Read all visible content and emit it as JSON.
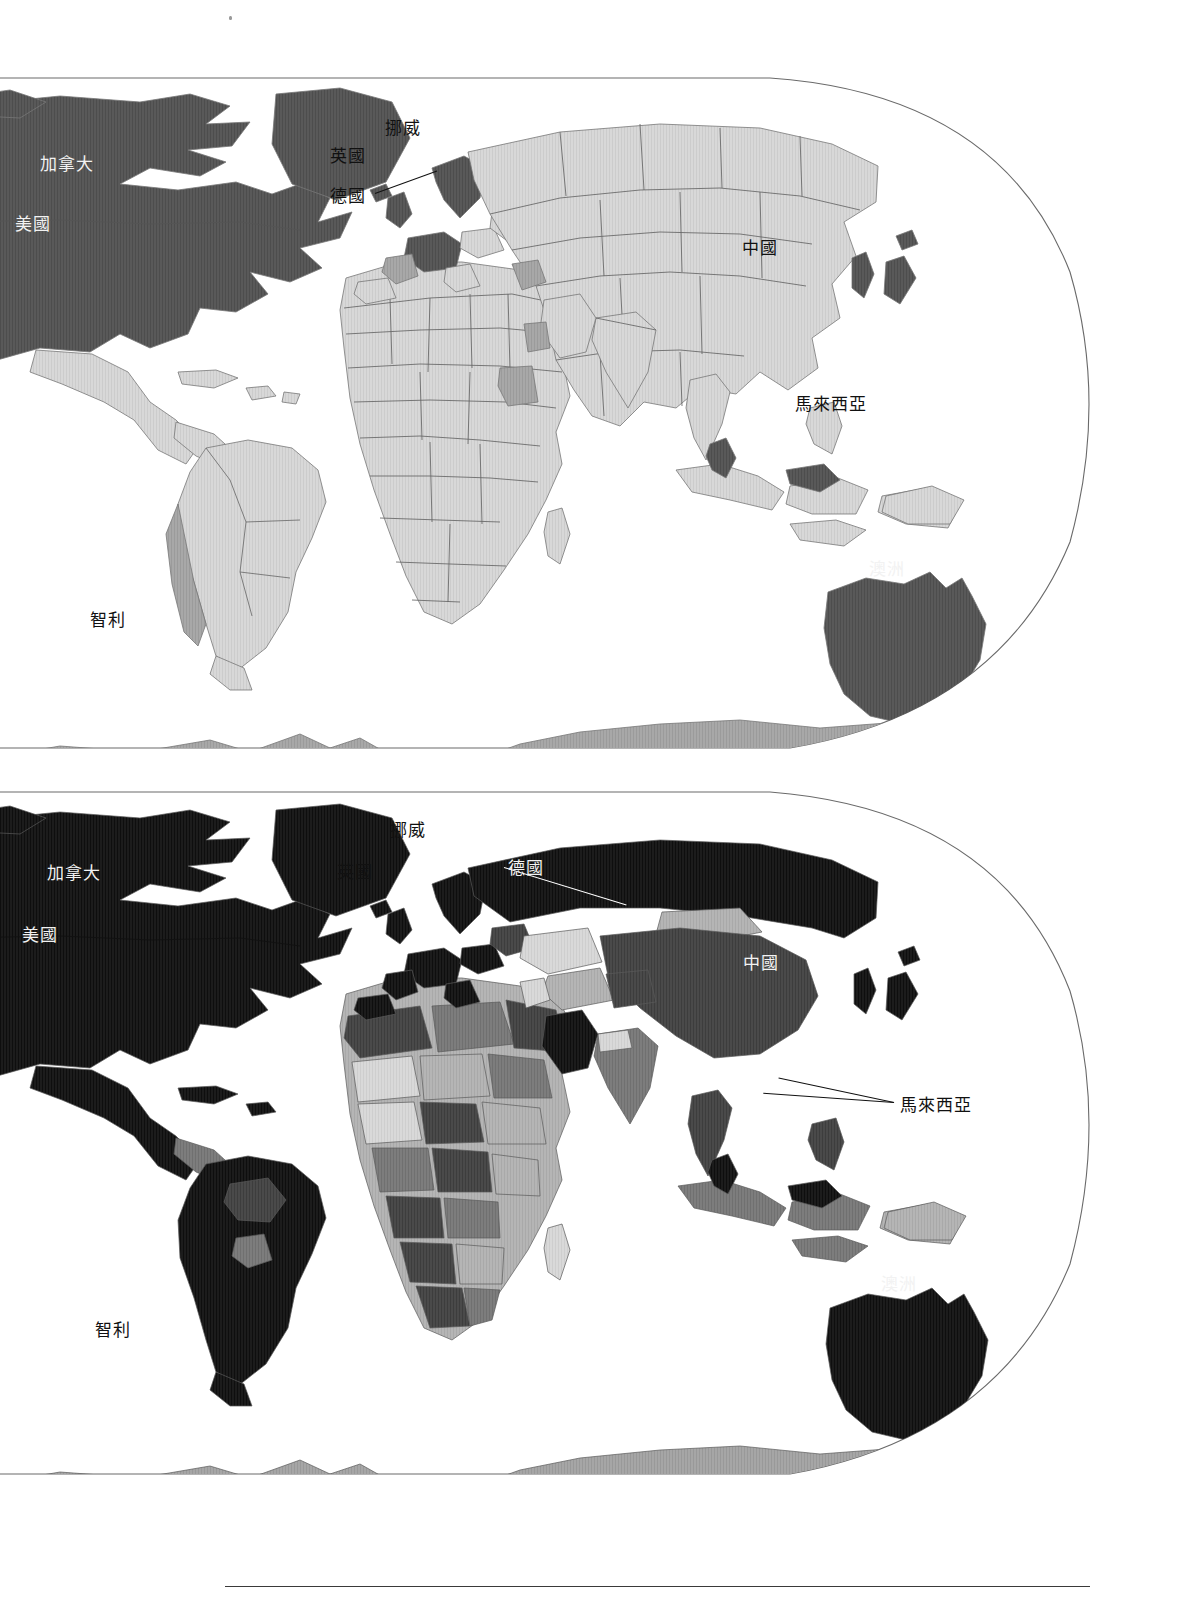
{
  "document": {
    "kind": "two-panel world choropleth map figure",
    "panel_count": 2,
    "footer_rule": true
  },
  "map_top": {
    "name": "upper-world-map",
    "style": "light-shaded choropleth, light-gray base countries, dark-gray highlighted countries",
    "labels": [
      {
        "id": "canada",
        "text": "加拿大",
        "x": 40,
        "y": 156,
        "tone": "light"
      },
      {
        "id": "usa",
        "text": "美國",
        "x": 15,
        "y": 216,
        "tone": "light"
      },
      {
        "id": "norway",
        "text": "挪威",
        "x": 385,
        "y": 120,
        "tone": "dark"
      },
      {
        "id": "uk",
        "text": "英國",
        "x": 330,
        "y": 148,
        "tone": "dark"
      },
      {
        "id": "germany",
        "text": "德國",
        "x": 330,
        "y": 188,
        "tone": "dark"
      },
      {
        "id": "china",
        "text": "中國",
        "x": 742,
        "y": 240,
        "tone": "dark"
      },
      {
        "id": "malaysia",
        "text": "馬來西亞",
        "x": 795,
        "y": 396,
        "tone": "dark"
      },
      {
        "id": "australia",
        "text": "澳洲",
        "x": 869,
        "y": 561,
        "tone": "light"
      },
      {
        "id": "chile",
        "text": "智利",
        "x": 90,
        "y": 612,
        "tone": "dark"
      }
    ],
    "leaders": [
      {
        "id": "germany-leader",
        "x": 375,
        "y": 193,
        "length": 66,
        "angle": -20,
        "tone": "dark"
      }
    ]
  },
  "map_bottom": {
    "name": "lower-world-map",
    "style": "dark-shaded choropleth, near-black highlighted countries, mid-gray other countries",
    "labels": [
      {
        "id": "canada",
        "text": "加拿大",
        "x": 47,
        "y": 865,
        "tone": "light"
      },
      {
        "id": "usa",
        "text": "美國",
        "x": 22,
        "y": 927,
        "tone": "light"
      },
      {
        "id": "norway",
        "text": "挪威",
        "x": 390,
        "y": 822,
        "tone": "dark"
      },
      {
        "id": "uk",
        "text": "英國",
        "x": 337,
        "y": 864,
        "tone": "dark"
      },
      {
        "id": "germany",
        "text": "德國",
        "x": 508,
        "y": 860,
        "tone": "light"
      },
      {
        "id": "china",
        "text": "中國",
        "x": 743,
        "y": 955,
        "tone": "light"
      },
      {
        "id": "malaysia",
        "text": "馬來西亞",
        "x": 900,
        "y": 1097,
        "tone": "dark"
      },
      {
        "id": "australia",
        "text": "澳洲",
        "x": 881,
        "y": 1276,
        "tone": "light"
      },
      {
        "id": "chile",
        "text": "智利",
        "x": 95,
        "y": 1322,
        "tone": "dark"
      }
    ],
    "leaders": [
      {
        "id": "germany-leader",
        "x": 504,
        "y": 867,
        "length": 128,
        "angle": 17,
        "tone": "light"
      },
      {
        "id": "malaysia-leader1",
        "x": 894,
        "y": 1102,
        "length": 131,
        "angle": 184,
        "tone": "dark"
      },
      {
        "id": "malaysia-leader2",
        "x": 894,
        "y": 1102,
        "length": 118,
        "angle": 192,
        "tone": "dark"
      }
    ]
  },
  "palette": {
    "highlight_top": "#595959",
    "base_top": "#d8d8d8",
    "outline_top": "#808080",
    "highlight_bottom": "#1a1a1a",
    "mid_bottom": "#6b6b6b",
    "light_bottom": "#cfcfcf",
    "antarctica": "#9c9c9c",
    "frame_line": "#555555",
    "page_background": "#ffffff"
  }
}
